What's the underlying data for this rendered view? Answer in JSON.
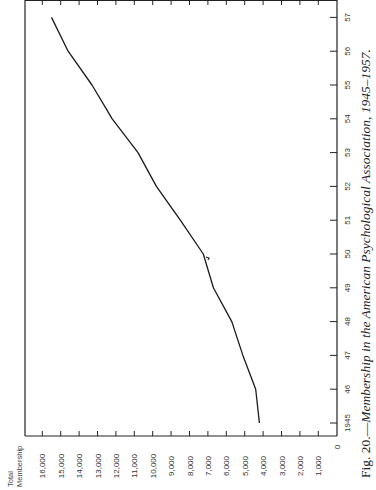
{
  "chart_data": {
    "type": "line",
    "orientation": "rotated-90-ccw",
    "title": "Fig. 20.—Membership in the American Psychological Association, 1945–1957.",
    "caption_prefix": "Fig. 20.—",
    "caption_italic": "Membership in the American Psychological Association, 1945–1957.",
    "xlabel": "",
    "ylabel": "Total Membership",
    "ylabel_lines": [
      "Total",
      "Membership"
    ],
    "x": [
      "1945",
      "46",
      "47",
      "48",
      "49",
      "50",
      "51",
      "52",
      "53",
      "54",
      "55",
      "56",
      "57"
    ],
    "x_numeric": [
      1945,
      1946,
      1947,
      1948,
      1949,
      1950,
      1951,
      1952,
      1953,
      1954,
      1955,
      1956,
      1957
    ],
    "series": [
      {
        "name": "Total Membership",
        "values": [
          4200,
          4400,
          5100,
          5700,
          6700,
          7250,
          8500,
          9800,
          10800,
          12200,
          13300,
          14600,
          15500
        ]
      }
    ],
    "y_ticks": [
      "0",
      "1,000",
      "2,000",
      "3,000",
      "4,000",
      "5,000",
      "6,000",
      "7,000",
      "8,000",
      "9,000",
      "10,000",
      "11,000",
      "12,000",
      "13,000",
      "14,000",
      "15,000",
      "16,000"
    ],
    "ylim": [
      0,
      16000
    ],
    "grid": false,
    "legend": "none"
  }
}
